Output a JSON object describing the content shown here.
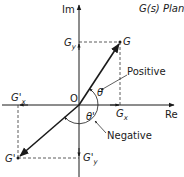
{
  "diagram": {
    "title": "G(s) Plane",
    "axes": {
      "real_label": "Re",
      "imag_label": "Im",
      "origin_label": "O"
    },
    "points": {
      "G": {
        "label": "G"
      },
      "G_prime": {
        "label": "G'"
      }
    },
    "projections": {
      "Gx": {
        "main": "G",
        "sub": "x"
      },
      "Gy": {
        "main": "G",
        "sub": "y"
      },
      "Gx_prime": {
        "main": "G'",
        "sub": "x"
      },
      "Gy_prime": {
        "main": "G'",
        "sub": "y"
      }
    },
    "angles": {
      "theta": "θ",
      "theta_prime": "θ'"
    },
    "annotations": {
      "positive": "Positive",
      "negative": "Negative"
    },
    "colors": {
      "line": "#1a1a1a",
      "dashed": "#333333",
      "background": "#ffffff"
    }
  }
}
